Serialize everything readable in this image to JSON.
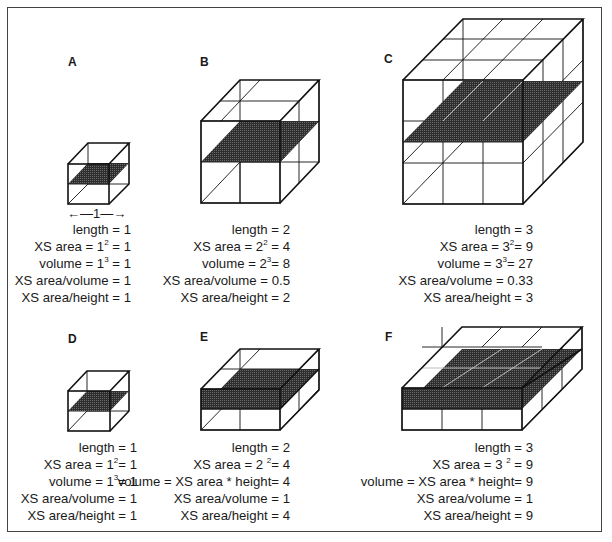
{
  "figure": {
    "title": "",
    "panels": [
      {
        "id": "A",
        "label": "A",
        "length": "1",
        "lines": [
          {
            "pre": "length  = 1",
            "sup": "",
            "post": ""
          },
          {
            "pre": "XS area = 1",
            "sup": "2",
            "post": " = 1"
          },
          {
            "pre": "volume = 1",
            "sup": "3",
            "post": " = 1"
          },
          {
            "pre": "XS area/volume = 1",
            "sup": "",
            "post": ""
          },
          {
            "pre": "XS area/height = 1",
            "sup": "",
            "post": ""
          }
        ],
        "dimension_marker": "←—1—→"
      },
      {
        "id": "B",
        "label": "B",
        "length": "2",
        "lines": [
          {
            "pre": "length  = 2",
            "sup": "",
            "post": ""
          },
          {
            "pre": "XS area = 2",
            "sup": "2",
            "post": " = 4"
          },
          {
            "pre": "volume = 2",
            "sup": "3",
            "post": "= 8"
          },
          {
            "pre": "XS area/volume = 0.5",
            "sup": "",
            "post": ""
          },
          {
            "pre": "XS area/height = 2",
            "sup": "",
            "post": ""
          }
        ]
      },
      {
        "id": "C",
        "label": "C",
        "length": "3",
        "lines": [
          {
            "pre": "length  = 3",
            "sup": "",
            "post": ""
          },
          {
            "pre": "XS area = 3",
            "sup": "2",
            "post": "= 9"
          },
          {
            "pre": "volume = 3",
            "sup": "3",
            "post": "= 27"
          },
          {
            "pre": "XS area/volume = 0.33",
            "sup": "",
            "post": ""
          },
          {
            "pre": "XS area/height = 3",
            "sup": "",
            "post": ""
          }
        ]
      },
      {
        "id": "D",
        "label": "D",
        "length": "1",
        "lines": [
          {
            "pre": "length  = 1",
            "sup": "",
            "post": ""
          },
          {
            "pre": "XS area = 1",
            "sup": "2",
            "post": "= 1"
          },
          {
            "pre": "volume = 1",
            "sup": "3",
            "post": "= 1"
          },
          {
            "pre": "XS area/volume = 1",
            "sup": "",
            "post": ""
          },
          {
            "pre": "XS area/height = 1",
            "sup": "",
            "post": ""
          }
        ]
      },
      {
        "id": "E",
        "label": "E",
        "length": "2",
        "lines": [
          {
            "pre": "length  = 2",
            "sup": "",
            "post": ""
          },
          {
            "pre": "XS area = 2 ",
            "sup": "2",
            "post": "= 4"
          },
          {
            "pre": "volume = XS area * height= 4",
            "sup": "",
            "post": ""
          },
          {
            "pre": "XS area/volume = 1",
            "sup": "",
            "post": ""
          },
          {
            "pre": "XS area/height = 4",
            "sup": "",
            "post": ""
          }
        ]
      },
      {
        "id": "F",
        "label": "F",
        "length": "3",
        "lines": [
          {
            "pre": "length  = 3",
            "sup": "",
            "post": ""
          },
          {
            "pre": "XS area = 3 ",
            "sup": "2",
            "post": " = 9"
          },
          {
            "pre": "volume = XS area * height= 9",
            "sup": "",
            "post": ""
          },
          {
            "pre": "XS area/volume = 1",
            "sup": "",
            "post": ""
          },
          {
            "pre": "XS area/height = 9",
            "sup": "",
            "post": ""
          }
        ]
      }
    ],
    "colors": {
      "line": "#111111",
      "slab": "#3a3a3a",
      "frame": "#444444"
    }
  }
}
